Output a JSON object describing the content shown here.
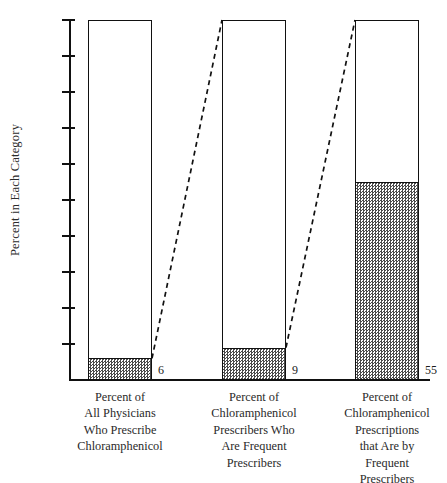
{
  "chart_data": {
    "type": "bar",
    "title": "",
    "subtitle": "",
    "xlabel": "",
    "ylabel": "Percent in Each Category",
    "ylim": [
      0,
      100
    ],
    "grid": false,
    "legend_position": "none",
    "y_ticks": [
      100,
      90,
      80,
      70,
      60,
      50,
      40,
      30,
      20,
      10
    ],
    "y_tick_labels": [
      "100",
      "90",
      "80",
      "70",
      "60",
      "50",
      "40",
      "30",
      "20",
      "10"
    ],
    "categories": [
      "Percent of\nAll Physicians\nWho Prescribe\nChloramphenicol",
      "Percent of\nChloramphenicol\nPrescribers Who\nAre Frequent\nPrescribers",
      "Percent of\nChloramphenicol\nPrescriptions\nthat Are by\nFrequent\nPrescribers"
    ],
    "values": [
      6,
      9,
      55
    ],
    "value_labels": [
      "6",
      "9",
      "55"
    ],
    "bar_total": 100,
    "annotations": [
      "Dashed line from top of shaded portion of bar 1 to top of bar 2",
      "Dashed line from top of shaded portion of bar 2 to top of bar 3"
    ],
    "colors": {
      "outline": "#111111",
      "fill_pattern": "#4a4a4a",
      "background": "#ffffff",
      "text": "#1b1b1b"
    }
  },
  "axis": {
    "y_title": "Percent in Each Category",
    "ticks": [
      {
        "label": "100",
        "value": 100
      },
      {
        "label": "90",
        "value": 90
      },
      {
        "label": "80",
        "value": 80
      },
      {
        "label": "70",
        "value": 70
      },
      {
        "label": "60",
        "value": 60
      },
      {
        "label": "50",
        "value": 50
      },
      {
        "label": "40",
        "value": 40
      },
      {
        "label": "30",
        "value": 30
      },
      {
        "label": "20",
        "value": 20
      },
      {
        "label": "10",
        "value": 10
      }
    ]
  },
  "bars": [
    {
      "value": 6,
      "value_label": "6",
      "caption": "Percent of\nAll Physicians\nWho Prescribe\nChloramphenicol"
    },
    {
      "value": 9,
      "value_label": "9",
      "caption": "Percent of\nChloramphenicol\nPrescribers Who\nAre Frequent\nPrescribers"
    },
    {
      "value": 55,
      "value_label": "55",
      "caption": "Percent of\nChloramphenicol\nPrescriptions\nthat Are by\nFrequent\nPrescribers"
    }
  ]
}
